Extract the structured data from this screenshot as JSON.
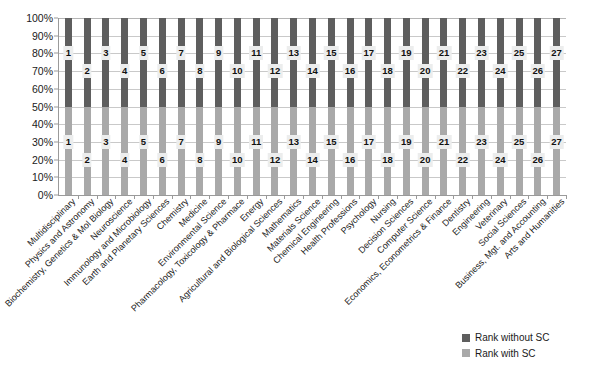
{
  "chart_data": {
    "type": "bar",
    "subtype": "100%-stacked-column",
    "title": "",
    "xlabel": "",
    "ylabel": "",
    "ylim": [
      0,
      100
    ],
    "ytick_labels": [
      "100%",
      "90%",
      "80%",
      "70%",
      "60%",
      "50%",
      "40%",
      "30%",
      "20%",
      "10%",
      "0%"
    ],
    "ytick_values": [
      100,
      90,
      80,
      70,
      60,
      50,
      40,
      30,
      20,
      10,
      0
    ],
    "grid": true,
    "legend_position": "bottom-right",
    "categories": [
      "Multidisciplinary",
      "Physics and Astronomy",
      "Biochemistry, Genetics & Mol Biology",
      "Neuroscience",
      "Immunology and Microbiology",
      "Earth and Planetary Sciences",
      "Chemistry",
      "Medicine",
      "Environmental Science",
      "Pharmacology, Toxicology & Pharmace",
      "Energy",
      "Agricultural and Biological Sciences",
      "Mathematics",
      "Materials Science",
      "Chemical Engineering",
      "Health Professions",
      "Psychology",
      "Nursing",
      "Decision Sciences",
      "Computer Science",
      "Economics, Econometrics & Finance",
      "Dentistry",
      "Engineering",
      "Veterinary",
      "Social Sciences",
      "Business, Mgt. and Accounting",
      "Arts and Humanities"
    ],
    "series": [
      {
        "name": "Rank without SC",
        "color": "#5e5e5e",
        "stack_share_percent": 50,
        "values": [
          1,
          2,
          3,
          4,
          5,
          6,
          7,
          8,
          9,
          10,
          11,
          12,
          13,
          14,
          15,
          16,
          17,
          18,
          19,
          20,
          21,
          22,
          23,
          24,
          25,
          26,
          27
        ]
      },
      {
        "name": "Rank with SC",
        "color": "#a9a9a9",
        "stack_share_percent": 50,
        "values": [
          1,
          2,
          3,
          4,
          5,
          6,
          7,
          8,
          9,
          10,
          11,
          12,
          13,
          14,
          15,
          16,
          17,
          18,
          19,
          20,
          21,
          22,
          23,
          24,
          25,
          26,
          27
        ]
      }
    ]
  },
  "legend": {
    "items": [
      {
        "label": "Rank without SC",
        "color": "#5e5e5e"
      },
      {
        "label": "Rank with SC",
        "color": "#a9a9a9"
      }
    ]
  }
}
